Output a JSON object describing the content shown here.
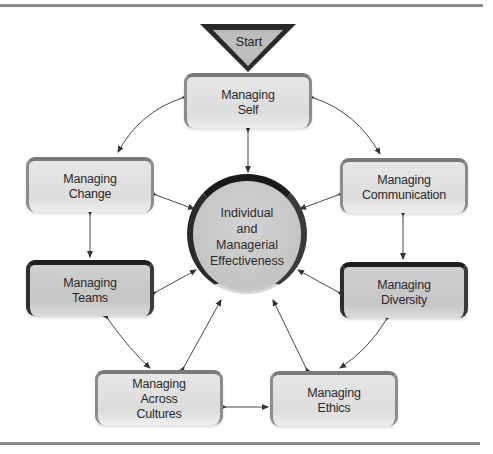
{
  "diagram": {
    "start": {
      "label": "Start"
    },
    "center": {
      "label": "Individual\nand\nManagerial\nEffectiveness"
    },
    "nodes": [
      {
        "id": "self",
        "label": "Managing\nSelf",
        "style": "light"
      },
      {
        "id": "change",
        "label": "Managing\nChange",
        "style": "light"
      },
      {
        "id": "communication",
        "label": "Managing\nCommunication",
        "style": "light"
      },
      {
        "id": "teams",
        "label": "Managing\nTeams",
        "style": "dark"
      },
      {
        "id": "diversity",
        "label": "Managing\nDiversity",
        "style": "dark"
      },
      {
        "id": "cultures",
        "label": "Managing\nAcross\nCultures",
        "style": "light"
      },
      {
        "id": "ethics",
        "label": "Managing\nEthics",
        "style": "light"
      }
    ],
    "edges": [
      [
        "start",
        "self"
      ],
      [
        "self",
        "center"
      ],
      [
        "self",
        "change"
      ],
      [
        "self",
        "communication"
      ],
      [
        "change",
        "teams"
      ],
      [
        "communication",
        "diversity"
      ],
      [
        "teams",
        "cultures"
      ],
      [
        "diversity",
        "ethics"
      ],
      [
        "cultures",
        "ethics"
      ],
      [
        "change",
        "center"
      ],
      [
        "communication",
        "center"
      ],
      [
        "teams",
        "center"
      ],
      [
        "diversity",
        "center"
      ],
      [
        "cultures",
        "center"
      ],
      [
        "ethics",
        "center"
      ]
    ],
    "colors": {
      "start_fill": "#bdbdbd",
      "start_border": "#2a2a2a",
      "light_fill": "#e2e2e2",
      "dark_fill": "#c9c9c9",
      "dark_border": "#1e1e1e",
      "rule": "#8a8a8a",
      "arrow": "#333333"
    }
  }
}
